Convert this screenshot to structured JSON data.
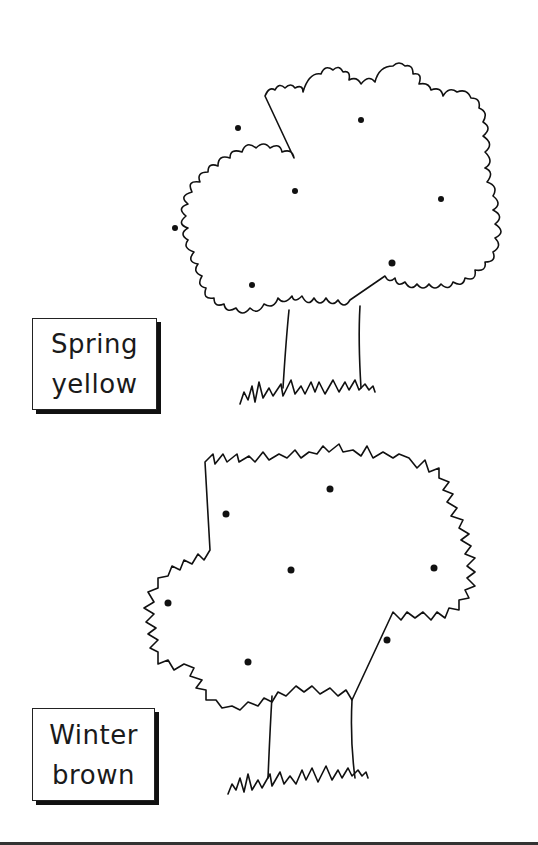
{
  "worksheet": {
    "trees": [
      {
        "id": "spring",
        "label_lines": [
          "Spring",
          "yellow"
        ],
        "fruit_dots": 7
      },
      {
        "id": "winter",
        "label_lines": [
          "Winter",
          "brown"
        ],
        "fruit_dots": 7
      }
    ],
    "colors": {
      "line": "#111111",
      "background": "#ffffff",
      "shadow": "#111111"
    }
  }
}
